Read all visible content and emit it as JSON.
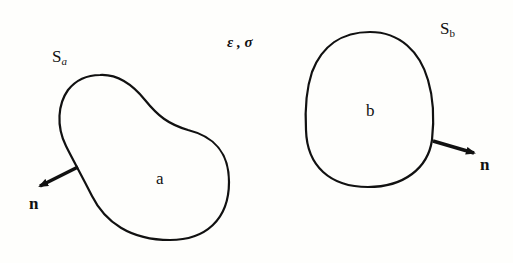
{
  "diagram": {
    "field": {
      "label": "ε , σ"
    },
    "bodies": [
      {
        "region_label": "a",
        "surface_label": "S",
        "surface_subscript": "a",
        "normal_label": "n"
      },
      {
        "region_label": "b",
        "surface_label": "S",
        "surface_subscript": "b",
        "normal_label": "n"
      }
    ],
    "colors": {
      "stroke": "#111111",
      "background": "#fefefc"
    }
  }
}
